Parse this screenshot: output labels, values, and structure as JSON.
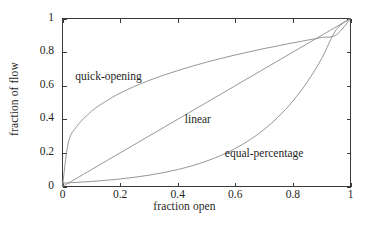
{
  "chart_data": {
    "type": "line",
    "title": "",
    "xlabel": "fraction open",
    "ylabel": "fraction of flow",
    "xlim": [
      0,
      1
    ],
    "ylim": [
      0,
      1
    ],
    "xticks": [
      "0",
      "0.2",
      "0.4",
      "0.6",
      "0.8",
      "1"
    ],
    "xtick_values": [
      0,
      0.2,
      0.4,
      0.6,
      0.8,
      1
    ],
    "yticks": [
      "0",
      "0.2",
      "0.4",
      "0.6",
      "0.8",
      "1"
    ],
    "ytick_values": [
      0,
      0.2,
      0.4,
      0.6,
      0.8,
      1
    ],
    "grid": false,
    "legend": "inline-annotations",
    "box": true,
    "tick_direction": "in",
    "line_color": "#8a8a8a",
    "axis_color": "#3a3a3a",
    "series": [
      {
        "name": "quick-opening",
        "label": "quick-opening",
        "label_x": 0.16,
        "label_y": 0.645,
        "formula": "y = x^0.35",
        "x": [
          0,
          0.02,
          0.05,
          0.1,
          0.15,
          0.2,
          0.25,
          0.3,
          0.35,
          0.4,
          0.45,
          0.5,
          0.55,
          0.6,
          0.65,
          0.7,
          0.75,
          0.8,
          0.85,
          0.9,
          0.95,
          1
        ],
        "values": [
          0,
          0.259,
          0.359,
          0.447,
          0.507,
          0.556,
          0.596,
          0.631,
          0.662,
          0.69,
          0.716,
          0.74,
          0.762,
          0.783,
          0.802,
          0.821,
          0.838,
          0.855,
          0.871,
          0.887,
          0.902,
          1
        ]
      },
      {
        "name": "linear",
        "label": "linear",
        "label_x": 0.47,
        "label_y": 0.39,
        "formula": "y = x",
        "x": [
          0,
          0.1,
          0.2,
          0.3,
          0.4,
          0.5,
          0.6,
          0.7,
          0.8,
          0.9,
          1
        ],
        "values": [
          0,
          0.1,
          0.2,
          0.3,
          0.4,
          0.5,
          0.6,
          0.7,
          0.8,
          0.9,
          1
        ]
      },
      {
        "name": "equal-percentage",
        "label": "equal-percentage",
        "label_x": 0.7,
        "label_y": 0.185,
        "formula": "y = 50^(x-1)",
        "x": [
          0,
          0.05,
          0.1,
          0.15,
          0.2,
          0.25,
          0.3,
          0.35,
          0.4,
          0.45,
          0.5,
          0.55,
          0.6,
          0.65,
          0.7,
          0.75,
          0.8,
          0.85,
          0.9,
          0.95,
          1
        ],
        "values": [
          0.02,
          0.0245,
          0.03,
          0.0367,
          0.0449,
          0.055,
          0.0673,
          0.0824,
          0.1009,
          0.1235,
          0.1512,
          0.185,
          0.2265,
          0.2773,
          0.3394,
          0.4155,
          0.5086,
          0.6226,
          0.7621,
          0.9329,
          1
        ]
      }
    ]
  },
  "axis_titles": {
    "x": "fraction open",
    "y": "fraction of flow"
  }
}
